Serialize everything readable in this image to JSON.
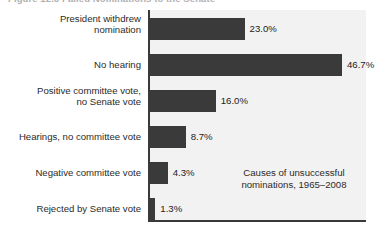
{
  "figure": {
    "title": "Figure 12.3    Failed Nominations to the Senate"
  },
  "annotation": {
    "line1": "Causes of unsuccessful",
    "line2": "nominations, 1965–2008"
  },
  "colors": {
    "bar": "#3a3a3a",
    "plot_background": "#f2f2f2",
    "axis": "#3a3a3a",
    "text": "#2b2b2b"
  },
  "chart_data": {
    "type": "bar",
    "orientation": "horizontal",
    "title": "Figure 12.3    Failed Nominations to the Senate",
    "xlabel": "",
    "ylabel": "",
    "xlim": [
      0,
      46.7
    ],
    "grid": false,
    "legend": null,
    "annotations": [
      "Causes of unsuccessful nominations, 1965–2008"
    ],
    "categories": [
      "President withdrew nomination",
      "No hearing",
      "Positive committee vote, no Senate vote",
      "Hearings, no committee vote",
      "Negative committee vote",
      "Rejected by Senate vote"
    ],
    "values": [
      23.0,
      46.7,
      16.0,
      8.7,
      4.3,
      1.3
    ],
    "value_labels": [
      "23.0%",
      "46.7%",
      "16.0%",
      "8.7%",
      "4.3%",
      "1.3%"
    ],
    "bars": [
      {
        "label_line1": "President withdrew",
        "label_line2": "nomination",
        "value": 23.0,
        "value_label": "23.0%"
      },
      {
        "label_line1": "No hearing",
        "label_line2": "",
        "value": 46.7,
        "value_label": "46.7%"
      },
      {
        "label_line1": "Positive committee vote,",
        "label_line2": "no Senate vote",
        "value": 16.0,
        "value_label": "16.0%"
      },
      {
        "label_line1": "Hearings, no committee vote",
        "label_line2": "",
        "value": 8.7,
        "value_label": "8.7%"
      },
      {
        "label_line1": "Negative committee vote",
        "label_line2": "",
        "value": 4.3,
        "value_label": "4.3%"
      },
      {
        "label_line1": "Rejected by Senate vote",
        "label_line2": "",
        "value": 1.3,
        "value_label": "1.3%"
      }
    ]
  }
}
